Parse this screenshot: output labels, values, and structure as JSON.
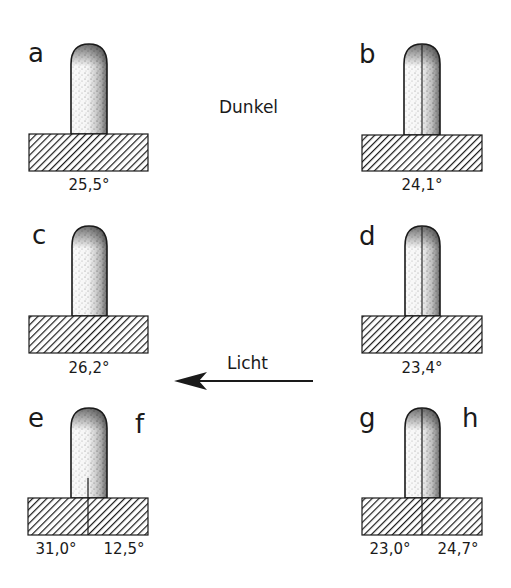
{
  "diagram": {
    "conditions": {
      "dark_label": "Dunkel",
      "light_label": "Licht",
      "light_direction": "right-to-left"
    },
    "panels": [
      {
        "id": "a",
        "label": "a",
        "temperatures": [
          "25,5°"
        ],
        "divider": "none"
      },
      {
        "id": "b",
        "label": "b",
        "temperatures": [
          "24,1°"
        ],
        "divider": "shoot-only"
      },
      {
        "id": "c",
        "label": "c",
        "temperatures": [
          "26,2°"
        ],
        "divider": "none"
      },
      {
        "id": "d",
        "label": "d",
        "temperatures": [
          "23,4°"
        ],
        "divider": "shoot-only"
      },
      {
        "id": "ef",
        "label_left": "e",
        "label_right": "f",
        "temperatures": [
          "31,0°",
          "12,5°"
        ],
        "divider": "lower-shoot-and-base"
      },
      {
        "id": "gh",
        "label_left": "g",
        "label_right": "h",
        "temperatures": [
          "23,0°",
          "24,7°"
        ],
        "divider": "full-shoot-and-base"
      }
    ],
    "colors": {
      "ink": "#1a1a1a",
      "background": "#ffffff",
      "stipple": "#5a5a5a"
    }
  }
}
